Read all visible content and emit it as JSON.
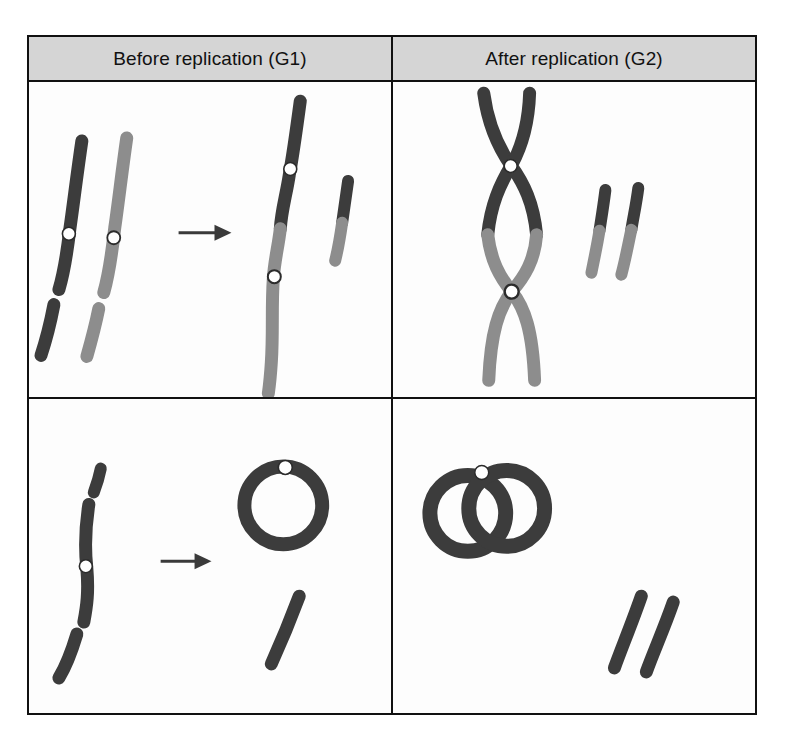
{
  "figure": {
    "columns": [
      {
        "id": "g1",
        "label": "Before replication (G1)"
      },
      {
        "id": "g2",
        "label": "After replication (G2)"
      }
    ],
    "rows": [
      {
        "id": "eukaryotic",
        "label": "Linear eukaryotic chromosomes"
      },
      {
        "id": "prokaryotic",
        "label": "Circular prokaryotic chromosome"
      }
    ],
    "colors": {
      "chromatid_dark": "#3c3c3c",
      "chromatid_gray": "#8d8d8d",
      "centromere_fill": "#ffffff",
      "centromere_stroke": "#2b2b2b",
      "border": "#111111",
      "header_background": "#d5d5d5",
      "panel_background": "#fdfdfd",
      "arrow": "#3a3a3a"
    },
    "panels": [
      {
        "id": "g1-linear",
        "row": "eukaryotic",
        "column": "g1",
        "arrow": "replication-arrow",
        "shapes": [
          {
            "name": "homolog-dark-long-arm",
            "color": "chromatid_dark",
            "centromeres": 1
          },
          {
            "name": "homolog-dark-short-fragment",
            "color": "chromatid_dark",
            "centromeres": 0
          },
          {
            "name": "homolog-gray-long-arm",
            "color": "chromatid_gray",
            "centromeres": 1
          },
          {
            "name": "homolog-gray-short-fragment",
            "color": "chromatid_gray",
            "centromeres": 0
          },
          {
            "name": "merged-chromosome-dark-gray",
            "color": "chromatid_dark+chromatid_gray",
            "centromeres": 2
          },
          {
            "name": "small-chromosome-dark-gray",
            "color": "chromatid_dark+chromatid_gray",
            "centromeres": 0
          }
        ]
      },
      {
        "id": "g2-linear",
        "row": "eukaryotic",
        "column": "g2",
        "arrow": null,
        "shapes": [
          {
            "name": "replicated-x-chromosome-dark",
            "color": "chromatid_dark",
            "centromeres": 1
          },
          {
            "name": "replicated-x-chromosome-gray",
            "color": "chromatid_gray",
            "centromeres": 1
          },
          {
            "name": "sister-chromatid-bar-1",
            "color": "chromatid_dark+chromatid_gray",
            "centromeres": 0
          },
          {
            "name": "sister-chromatid-bar-2",
            "color": "chromatid_dark+chromatid_gray",
            "centromeres": 0
          }
        ]
      },
      {
        "id": "g1-circular",
        "row": "prokaryotic",
        "column": "g1",
        "arrow": "replication-arrow",
        "shapes": [
          {
            "name": "linear-chromosome-top-cap",
            "color": "chromatid_dark",
            "centromeres": 0
          },
          {
            "name": "linear-chromosome-middle",
            "color": "chromatid_dark",
            "centromeres": 1
          },
          {
            "name": "linear-chromosome-bottom-fragment",
            "color": "chromatid_dark",
            "centromeres": 0
          },
          {
            "name": "circular-chromosome",
            "color": "chromatid_dark",
            "centromeres": 1
          },
          {
            "name": "linear-fragment",
            "color": "chromatid_dark",
            "centromeres": 0
          }
        ]
      },
      {
        "id": "g2-circular",
        "row": "prokaryotic",
        "column": "g2",
        "arrow": null,
        "shapes": [
          {
            "name": "replicated-circular-chromosome-pair",
            "color": "chromatid_dark",
            "centromeres": 1
          },
          {
            "name": "linear-fragment-1",
            "color": "chromatid_dark",
            "centromeres": 0
          },
          {
            "name": "linear-fragment-2",
            "color": "chromatid_dark",
            "centromeres": 0
          }
        ]
      }
    ]
  }
}
